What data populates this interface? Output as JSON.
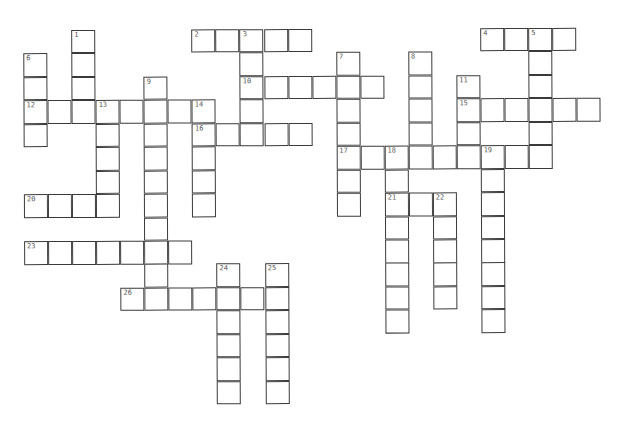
{
  "puzzle": {
    "type": "crossword",
    "entries": [
      {
        "number": "1",
        "direction": "down",
        "row": 1,
        "col": 2,
        "length": 4
      },
      {
        "number": "2",
        "direction": "across",
        "row": 1,
        "col": 7,
        "length": 5
      },
      {
        "number": "3",
        "direction": "down",
        "row": 1,
        "col": 9,
        "length": 5
      },
      {
        "number": "4",
        "direction": "across",
        "row": 1,
        "col": 19,
        "length": 4
      },
      {
        "number": "5",
        "direction": "down",
        "row": 1,
        "col": 21,
        "length": 6
      },
      {
        "number": "6",
        "direction": "down",
        "row": 2,
        "col": 0,
        "length": 4
      },
      {
        "number": "7",
        "direction": "down",
        "row": 2,
        "col": 13,
        "length": 7
      },
      {
        "number": "8",
        "direction": "down",
        "row": 2,
        "col": 16,
        "length": 5
      },
      {
        "number": "9",
        "direction": "down",
        "row": 3,
        "col": 5,
        "length": 10
      },
      {
        "number": "10",
        "direction": "across",
        "row": 3,
        "col": 9,
        "length": 6
      },
      {
        "number": "11",
        "direction": "down",
        "row": 3,
        "col": 18,
        "length": 4
      },
      {
        "number": "12",
        "direction": "across",
        "row": 4,
        "col": 0,
        "length": 8
      },
      {
        "number": "13",
        "direction": "down",
        "row": 4,
        "col": 3,
        "length": 5
      },
      {
        "number": "14",
        "direction": "down",
        "row": 4,
        "col": 7,
        "length": 5
      },
      {
        "number": "15",
        "direction": "across",
        "row": 4,
        "col": 18,
        "length": 6
      },
      {
        "number": "16",
        "direction": "across",
        "row": 5,
        "col": 7,
        "length": 5
      },
      {
        "number": "17",
        "direction": "across",
        "row": 6,
        "col": 13,
        "length": 9
      },
      {
        "number": "18",
        "direction": "down",
        "row": 6,
        "col": 15,
        "length": 8
      },
      {
        "number": "19",
        "direction": "down",
        "row": 6,
        "col": 19,
        "length": 8
      },
      {
        "number": "20",
        "direction": "across",
        "row": 8,
        "col": 0,
        "length": 4
      },
      {
        "number": "21",
        "direction": "across",
        "row": 8,
        "col": 15,
        "length": 3
      },
      {
        "number": "22",
        "direction": "down",
        "row": 8,
        "col": 17,
        "length": 5
      },
      {
        "number": "23",
        "direction": "across",
        "row": 10,
        "col": 0,
        "length": 7
      },
      {
        "number": "24",
        "direction": "down",
        "row": 11,
        "col": 8,
        "length": 6
      },
      {
        "number": "25",
        "direction": "down",
        "row": 11,
        "col": 10,
        "length": 6
      },
      {
        "number": "26",
        "direction": "across",
        "row": 12,
        "col": 4,
        "length": 7
      }
    ]
  }
}
